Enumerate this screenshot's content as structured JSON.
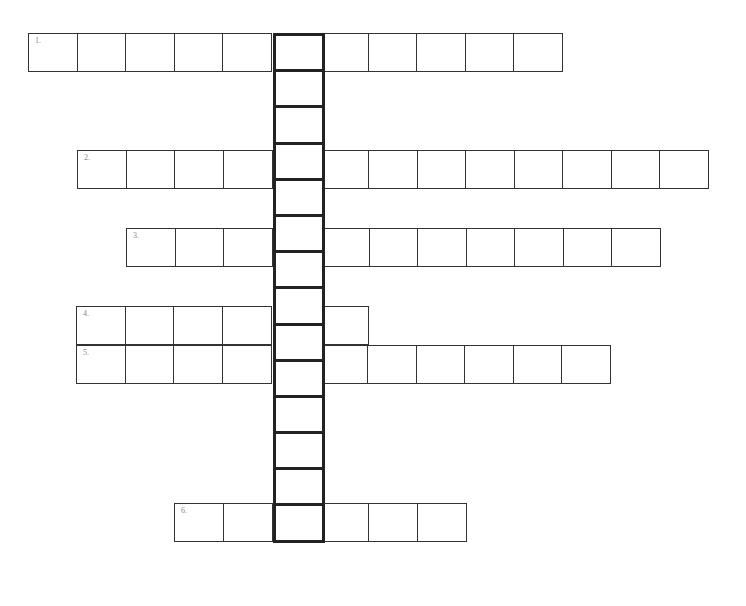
{
  "header": {
    "cropped_text_line": ""
  },
  "puzzle": {
    "type": "crossword-acrostic",
    "border_color": "#333333",
    "key_border_color": "#222222",
    "clue_number_color": "#8a8a8a",
    "key_column": {
      "cells": 14,
      "x": 273,
      "top": 33,
      "bottom": 582
    },
    "rows": [
      {
        "number": "1.",
        "cells": 11,
        "key_index": 5,
        "left": 28,
        "top": 33
      },
      {
        "number": "2.",
        "cells": 13,
        "key_index": 4,
        "left": 77,
        "top": 150
      },
      {
        "number": "3.",
        "cells": 11,
        "key_index": 3,
        "left": 126,
        "top": 228
      },
      {
        "number": "4.",
        "cells": 6,
        "key_index": 4,
        "left": 76,
        "top": 306
      },
      {
        "number": "5.",
        "cells": 11,
        "key_index": 4,
        "left": 76,
        "top": 345
      },
      {
        "number": "6.",
        "cells": 6,
        "key_index": 2,
        "left": 174,
        "top": 503
      }
    ]
  }
}
